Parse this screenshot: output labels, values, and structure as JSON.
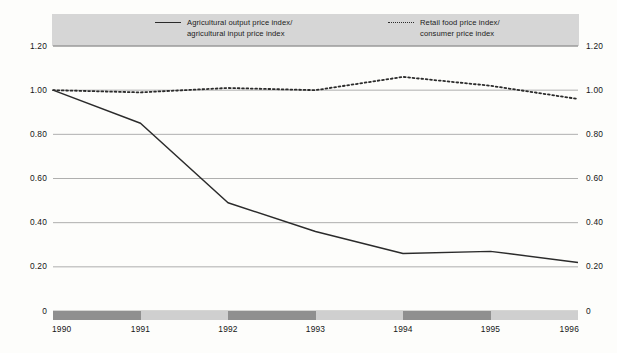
{
  "legend": {
    "entries": [
      {
        "style": "solid",
        "line1": "Agricultural output price index/",
        "line2": "agricultural input price index"
      },
      {
        "style": "dotted",
        "line1": "Retail food price index/",
        "line2": "consumer price index"
      }
    ]
  },
  "axis": {
    "y_left": [
      "1.20",
      "1.00",
      "0.80",
      "0.60",
      "0.40",
      "0.20",
      "0"
    ],
    "y_right": [
      "1.20",
      "1.00",
      "0.80",
      "0.60",
      "0.40",
      "0.20",
      "0"
    ],
    "x": [
      "1990",
      "1991",
      "1992",
      "1993",
      "1994",
      "1995",
      "1996"
    ]
  },
  "colors": {
    "line": "#2b2b2b",
    "gridline": "#9a9a9a",
    "legend_band": "#d6d6d6",
    "band_dark": "#8f8f8f",
    "band_light": "#cfcfcf",
    "background": "#fdfdfb",
    "text": "#161616"
  },
  "chart_data": {
    "type": "line",
    "title": "",
    "xlabel": "",
    "ylabel": "",
    "x": [
      "1990",
      "1991",
      "1992",
      "1993",
      "1994",
      "1995",
      "1996"
    ],
    "ylim": [
      0,
      1.2
    ],
    "yticks": [
      0,
      0.2,
      0.4,
      0.6,
      0.8,
      1.0,
      1.2
    ],
    "grid": true,
    "legend_position": "top",
    "series": [
      {
        "name": "Agricultural output price index/agricultural input price index",
        "style": "solid",
        "values": [
          1.0,
          0.85,
          0.49,
          0.36,
          0.26,
          0.27,
          0.22
        ]
      },
      {
        "name": "Retail food price index/consumer price index",
        "style": "dotted",
        "values": [
          1.0,
          0.99,
          1.01,
          1.0,
          1.06,
          1.02,
          0.96
        ]
      }
    ]
  }
}
